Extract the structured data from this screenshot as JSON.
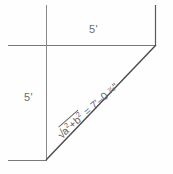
{
  "diagram": {
    "type": "technical-drawing",
    "background_color": "#fefefe",
    "line_color": "#5a5a5a",
    "text_color": "#6d6d6d",
    "labels": {
      "top_dimension": "5'",
      "left_dimension": "5'",
      "hypotenuse_equation": {
        "radical_sign": "√",
        "radicand_a": "a",
        "exponent_a": "2",
        "plus": "+",
        "radicand_b": "b",
        "exponent_b": "2",
        "equals": "=",
        "feet_value": "7'",
        "dash": "–",
        "inches_whole": "0",
        "fraction": "⅞",
        "inch_mark": "\""
      },
      "hypotenuse_full_text": "√a²+b² = 7'-0 ⅞\""
    },
    "geometry": {
      "triangle_legs_feet": 5,
      "hypotenuse_feet_inches": "7'-0 7/8\"",
      "corner_bottom_left": [
        46,
        160
      ],
      "corner_top_right": [
        156,
        45
      ],
      "extension_line_top_left_x": 8,
      "extension_line_top_y": 45,
      "extension_line_bottom_y": 160,
      "vertical_line_x": 46,
      "vertical_line_top_y": 5,
      "right_vertical_x": 156,
      "right_vertical_top_y": 5
    }
  }
}
